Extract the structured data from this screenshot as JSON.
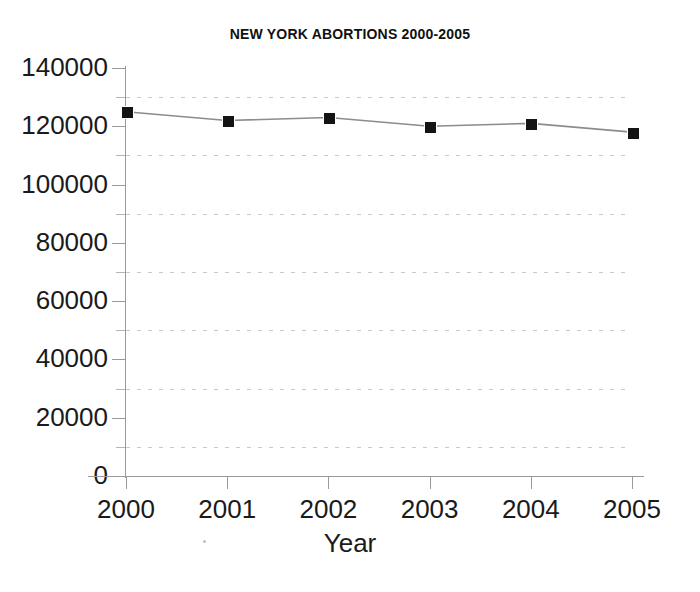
{
  "chart_data": {
    "type": "line",
    "title": "NEW YORK ABORTIONS 2000-2005",
    "xlabel": "Year",
    "ylabel": "",
    "categories": [
      "2000",
      "2001",
      "2002",
      "2003",
      "2004",
      "2005"
    ],
    "values": [
      125000,
      122000,
      123000,
      120000,
      121000,
      118000
    ],
    "series": [
      {
        "name": "New York abortions",
        "values": [
          125000,
          122000,
          123000,
          120000,
          121000,
          118000
        ]
      }
    ],
    "ylim": [
      0,
      140000
    ],
    "xlim": [
      "2000",
      "2005"
    ],
    "ytick_labels": [
      "0",
      "20000",
      "40000",
      "60000",
      "80000",
      "100000",
      "120000",
      "140000"
    ],
    "ytick_values": [
      0,
      20000,
      40000,
      60000,
      80000,
      100000,
      120000,
      140000
    ],
    "yminor_values": [
      10000,
      30000,
      50000,
      70000,
      90000,
      110000,
      130000
    ],
    "xtick_labels": [
      "2000",
      "2001",
      "2002",
      "2003",
      "2004",
      "2005"
    ],
    "grid": "horizontal-minor-dashed",
    "legend": "none",
    "marker": "square",
    "colors": {
      "line": "#8c8c8c",
      "marker": "#141414",
      "grid": "#c9c9c9",
      "axis": "#9a9a9a",
      "text": "#1a1a1a",
      "background": "#ffffff"
    }
  }
}
